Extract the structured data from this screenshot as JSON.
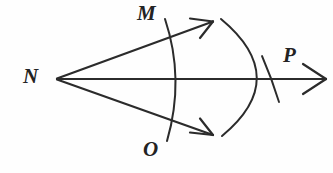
{
  "figure": {
    "background_color": "#fefefe",
    "ink_color": "#2b2b2b",
    "width": 333,
    "height": 173
  },
  "labels": {
    "vertex": "N",
    "upper_ray_point": "M",
    "lower_ray_point": "O",
    "bisector_point": "P"
  },
  "geometry": {
    "vertex_point": {
      "x": 57,
      "y": 78
    },
    "upper_ray": {
      "x1": 57,
      "y1": 78,
      "x2": 212,
      "y2": 22
    },
    "lower_ray": {
      "x1": 57,
      "y1": 78,
      "x2": 212,
      "y2": 135
    },
    "bisector_ray": {
      "x1": 57,
      "y1": 79,
      "x2": 325,
      "y2": 79
    },
    "small_arc": {
      "start_x": 165,
      "start_y": 19,
      "ctrl_x": 185,
      "ctrl_y": 79,
      "end_x": 167,
      "end_y": 141
    },
    "large_arc": {
      "start_x": 221,
      "start_y": 19,
      "ctrl_x": 292,
      "ctrl_y": 78,
      "end_x": 222,
      "end_y": 136
    },
    "p_tick": {
      "x1": 262,
      "y1": 57,
      "x2": 279,
      "y2": 101
    }
  },
  "icons": {
    "upper_arrowhead": "arrowhead-icon",
    "lower_arrowhead": "arrowhead-icon",
    "right_arrowhead": "arrowhead-icon"
  }
}
